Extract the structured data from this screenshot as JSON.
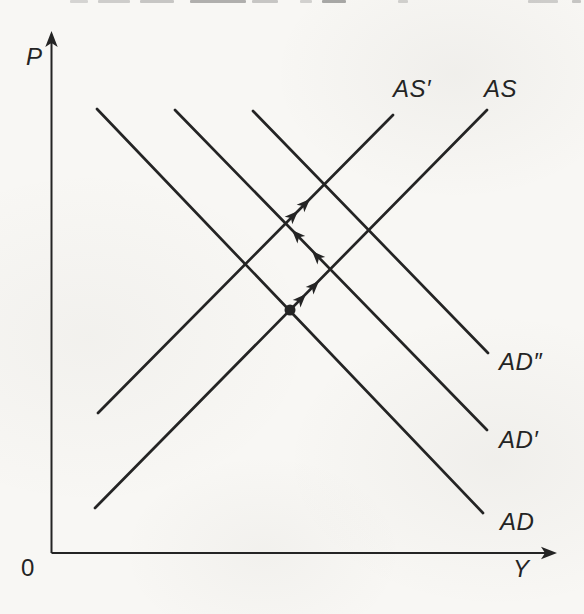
{
  "figure": {
    "ink_color": "#242424",
    "paper_color": "#f8f7f4"
  },
  "chart_data": {
    "type": "line",
    "xlabel": "Y",
    "ylabel": "P",
    "origin_label": "0",
    "grid": false,
    "axis_ticks": "none (qualitative diagram)",
    "axes_px": {
      "origin": [
        51.5,
        553
      ],
      "x_end": [
        557,
        553
      ],
      "y_end": [
        51.5,
        31
      ]
    },
    "xlabel_pos_px": [
      513,
      556
    ],
    "ylabel_pos_px": [
      26,
      44
    ],
    "origin_pos_px": [
      21,
      555
    ],
    "series": [
      {
        "id": "AS",
        "name": "AS",
        "kind": "aggregate-supply",
        "slope": "upward",
        "px": [
          [
            95,
            508
          ],
          [
            487,
            110
          ]
        ],
        "label_pos_px": [
          484,
          76
        ]
      },
      {
        "id": "AS-prime",
        "name": "AS′",
        "kind": "aggregate-supply",
        "slope": "upward",
        "px": [
          [
            98,
            413
          ],
          [
            393,
            115
          ]
        ],
        "label_pos_px": [
          393,
          76
        ]
      },
      {
        "id": "AD",
        "name": "AD",
        "kind": "aggregate-demand",
        "slope": "downward",
        "px": [
          [
            97,
            109
          ],
          [
            483,
            513
          ]
        ],
        "label_pos_px": [
          500,
          509
        ]
      },
      {
        "id": "AD-prime",
        "name": "AD′",
        "kind": "aggregate-demand",
        "slope": "downward",
        "px": [
          [
            175,
            110
          ],
          [
            487,
            430
          ]
        ],
        "label_pos_px": [
          499,
          427
        ]
      },
      {
        "id": "AD-double-prime",
        "name": "AD″",
        "kind": "aggregate-demand",
        "slope": "downward",
        "px": [
          [
            253,
            111
          ],
          [
            488,
            353
          ]
        ],
        "label_pos_px": [
          499,
          349
        ]
      }
    ],
    "equilibrium_dot_px": [
      290,
      310
    ],
    "equilibrium_dot_at": "intersection of AD and AS",
    "adjustment_path_px": [
      [
        290,
        310
      ],
      [
        330,
        269
      ],
      [
        286,
        223
      ],
      [
        324,
        185
      ]
    ],
    "adjustment_path_meaning": "dot at AD∩AS, up along AS to AD′, up-left along AD′ to AS′, up along AS′ to AD″",
    "path_arrowheads": [
      {
        "x": 306,
        "y": 294,
        "angle_deg": -45.7
      },
      {
        "x": 319,
        "y": 281,
        "angle_deg": -45.7
      },
      {
        "x": 312,
        "y": 251,
        "angle_deg": -133.7
      },
      {
        "x": 292,
        "y": 230,
        "angle_deg": -133.7
      },
      {
        "x": 298,
        "y": 211,
        "angle_deg": -45
      },
      {
        "x": 310,
        "y": 199,
        "angle_deg": -45
      }
    ]
  },
  "page_artifacts": {
    "description": "faint cropped text fragments from book scan along top edge",
    "marks": [
      {
        "x": 70,
        "w": 18,
        "opacity": 0.18
      },
      {
        "x": 98,
        "w": 32,
        "opacity": 0.22
      },
      {
        "x": 140,
        "w": 34,
        "opacity": 0.26
      },
      {
        "x": 190,
        "w": 56,
        "opacity": 0.38
      },
      {
        "x": 252,
        "w": 26,
        "opacity": 0.26
      },
      {
        "x": 300,
        "w": 12,
        "opacity": 0.2
      },
      {
        "x": 322,
        "w": 24,
        "opacity": 0.42
      },
      {
        "x": 398,
        "w": 10,
        "opacity": 0.2
      },
      {
        "x": 528,
        "w": 30,
        "opacity": 0.22
      },
      {
        "x": 572,
        "w": 9,
        "opacity": 0.26
      }
    ]
  }
}
